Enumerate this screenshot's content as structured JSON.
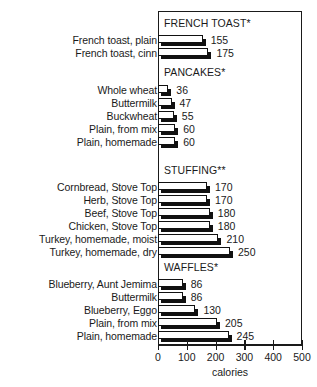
{
  "chart_data": {
    "type": "bar",
    "orientation": "horizontal",
    "title": "",
    "xlabel": "calories",
    "ylabel": "",
    "xlim": [
      0,
      500
    ],
    "xticks": [
      0,
      100,
      200,
      300,
      400,
      500
    ],
    "xtick_labels": [
      "0",
      "100",
      "200",
      "300",
      "400",
      "500"
    ],
    "grid": false,
    "legend": "none",
    "value_labels": true,
    "groups": [
      {
        "name": "FRENCH TOAST*",
        "categories": [
          "French toast, plain",
          "French toast, cinn"
        ],
        "values": [
          155,
          175
        ]
      },
      {
        "name": "PANCAKES*",
        "categories": [
          "Whole wheat",
          "Buttermilk",
          "Buckwheat",
          "Plain, from mix",
          "Plain, homemade"
        ],
        "values": [
          36,
          47,
          55,
          60,
          60
        ]
      },
      {
        "name": "STUFFING**",
        "categories": [
          "Cornbread, Stove Top",
          "Herb, Stove Top",
          "Beef, Stove Top",
          "Chicken, Stove Top",
          "Turkey, homemade, moist",
          "Turkey, homemade, dry"
        ],
        "values": [
          170,
          170,
          180,
          180,
          210,
          250
        ]
      },
      {
        "name": "WAFFLES*",
        "categories": [
          "Blueberry, Aunt Jemima",
          "Buttermilk",
          "Blueberry, Eggo",
          "Plain, from mix",
          "Plain, homemade"
        ],
        "values": [
          86,
          86,
          130,
          205,
          245
        ]
      }
    ],
    "categories": [
      "French toast, plain",
      "French toast, cinn",
      "Whole wheat",
      "Buttermilk",
      "Buckwheat",
      "Plain, from mix",
      "Plain, homemade",
      "Cornbread, Stove Top",
      "Herb, Stove Top",
      "Beef, Stove Top",
      "Chicken, Stove Top",
      "Turkey, homemade, moist",
      "Turkey, homemade, dry",
      "Blueberry, Aunt Jemima",
      "Buttermilk",
      "Blueberry, Eggo",
      "Plain, from mix",
      "Plain, homemade"
    ],
    "values": [
      155,
      175,
      36,
      47,
      55,
      60,
      60,
      170,
      170,
      180,
      180,
      210,
      250,
      86,
      86,
      130,
      205,
      245
    ]
  },
  "style": {
    "bar_face_color": "#ffffff",
    "bar_shadow_color": "#111111",
    "axis_color": "#1a1a1a",
    "background": "#ffffff"
  }
}
